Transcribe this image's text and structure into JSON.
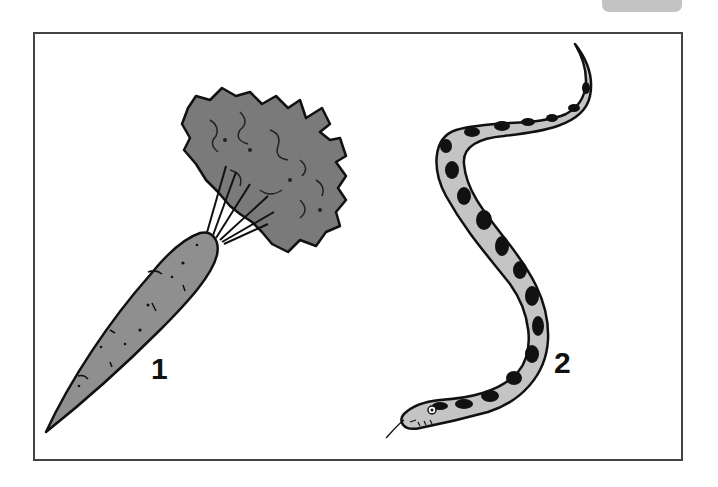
{
  "figure": {
    "items": [
      {
        "number": "1",
        "subject": "carrot",
        "description": "Carrot with leafy green top"
      },
      {
        "number": "2",
        "subject": "snake",
        "description": "Spotted snake with forked tongue"
      }
    ]
  },
  "colors": {
    "frame_border": "#444444",
    "carrot_fill": "#8f8f8f",
    "leaf_fill": "#7a7a7a",
    "snake_fill": "#c4c4c4",
    "outline": "#111111"
  }
}
